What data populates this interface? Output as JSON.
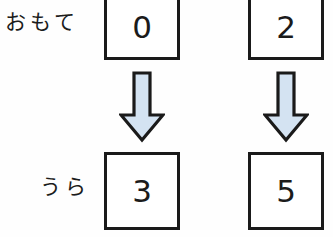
{
  "diagram": {
    "type": "card-flip-mapping",
    "rows": [
      {
        "label": "おもて",
        "label_name": "front-side",
        "cells": [
          {
            "value": "0"
          },
          {
            "value": "2"
          }
        ]
      },
      {
        "label": "うら",
        "label_name": "back-side",
        "cells": [
          {
            "value": "3"
          },
          {
            "value": "5"
          }
        ]
      }
    ],
    "arrows": [
      {
        "direction": "down"
      },
      {
        "direction": "down"
      }
    ],
    "colors": {
      "background": "#fefefe",
      "box_border": "#1a1a1a",
      "box_fill": "#ffffff",
      "digit": "#1b1b1b",
      "arrow_fill": "#d4e3f2",
      "arrow_outline": "#1a1a1a"
    }
  }
}
